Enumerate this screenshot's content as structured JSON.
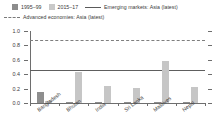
{
  "chart_data": {
    "type": "bar",
    "title": "",
    "subtitle": "",
    "xlabel": "",
    "ylabel": "",
    "ylim": [
      0.0,
      1.0
    ],
    "ytick_labels": [
      "0.0",
      "0.2",
      "0.4",
      "0.6",
      "0.8",
      "1.0"
    ],
    "ytick_values": [
      0.0,
      0.2,
      0.4,
      0.6,
      0.8,
      1.0
    ],
    "grid": false,
    "legend_position": "top",
    "categories": [
      "Bangladesh",
      "Bhutan",
      "India",
      "Sri Lanka",
      "Maldives",
      "Nepal"
    ],
    "series": [
      {
        "name": "1995–99",
        "color": "#8e8e8e",
        "values": [
          0.15,
          0.02,
          0.02,
          0.02,
          0.02,
          0.02
        ]
      },
      {
        "name": "2015–17",
        "color": "#c6c6c6",
        "values": [
          0.03,
          0.43,
          0.24,
          0.21,
          0.59,
          0.22
        ]
      }
    ],
    "reference_lines": [
      {
        "name": "Emerging markets: Asia (latest)",
        "value": 0.46,
        "style": "solid",
        "color": "#5e5e5e"
      },
      {
        "name": "Advanced economies: Asia (latest)",
        "value": 0.87,
        "style": "dashed",
        "color": "#7e7e7e"
      }
    ]
  },
  "legend": {
    "items": [
      {
        "label": "1995–99",
        "marker": "square-dark"
      },
      {
        "label": "2015–17",
        "marker": "square-light"
      },
      {
        "label": "Emerging markets: Asia (latest)",
        "marker": "solid-line"
      },
      {
        "label": "Advanced economies: Asia (latest)",
        "marker": "dashed-line"
      }
    ]
  }
}
